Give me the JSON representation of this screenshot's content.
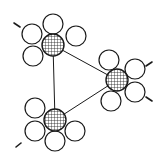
{
  "diagram": {
    "title": "Three-cluster molecular arrangement",
    "style": {
      "stroke": "#1a1a1a",
      "fill": "#ffffff",
      "hatch": "#1a1a1a"
    },
    "hubs": [
      {
        "id": "top",
        "cx": 53,
        "cy": 45,
        "r": 11
      },
      {
        "id": "right",
        "cx": 117,
        "cy": 80,
        "r": 11
      },
      {
        "id": "bottom",
        "cx": 55,
        "cy": 120,
        "r": 11
      }
    ],
    "satellites": [
      {
        "hub": "top",
        "cx": 53,
        "cy": 24,
        "r": 10
      },
      {
        "hub": "top",
        "cx": 76,
        "cy": 36,
        "r": 10
      },
      {
        "hub": "top",
        "cx": 32,
        "cy": 34,
        "r": 10
      },
      {
        "hub": "top",
        "cx": 33,
        "cy": 56,
        "r": 10
      },
      {
        "hub": "right",
        "cx": 109,
        "cy": 60,
        "r": 10
      },
      {
        "hub": "right",
        "cx": 135,
        "cy": 69,
        "r": 10
      },
      {
        "hub": "right",
        "cx": 135,
        "cy": 92,
        "r": 10
      },
      {
        "hub": "right",
        "cx": 111,
        "cy": 101,
        "r": 10
      },
      {
        "hub": "bottom",
        "cx": 35,
        "cy": 108,
        "r": 10
      },
      {
        "hub": "bottom",
        "cx": 75,
        "cy": 131,
        "r": 10
      },
      {
        "hub": "bottom",
        "cx": 55,
        "cy": 141,
        "r": 10
      },
      {
        "hub": "bottom",
        "cx": 35,
        "cy": 131,
        "r": 10
      }
    ],
    "edges": [
      {
        "from": "top",
        "to": "right"
      },
      {
        "from": "top",
        "to": "bottom"
      },
      {
        "from": "bottom",
        "to": "right"
      }
    ],
    "arrows": [
      {
        "x1": 14,
        "y1": 23,
        "x2": 20,
        "y2": 27
      },
      {
        "x1": 152,
        "y1": 62,
        "x2": 146,
        "y2": 66
      },
      {
        "x1": 152,
        "y1": 101,
        "x2": 146,
        "y2": 97
      },
      {
        "x1": 16,
        "y1": 147,
        "x2": 21,
        "y2": 143
      }
    ]
  }
}
